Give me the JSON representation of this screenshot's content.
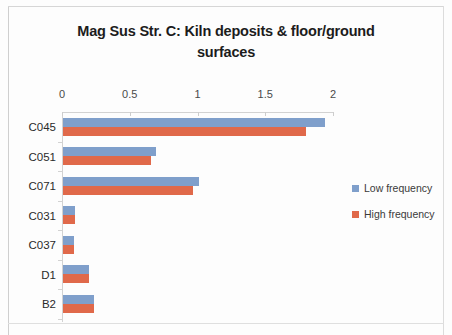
{
  "chart_data": {
    "type": "bar",
    "orientation": "horizontal",
    "title": "Mag Sus Str. C: Kiln deposits & floor/ground surfaces",
    "title_line1": "Mag Sus Str. C: Kiln deposits & floor/ground",
    "title_line2": "surfaces",
    "xlabel": "",
    "ylabel": "",
    "xlim": [
      0,
      2
    ],
    "xticks": [
      "0",
      "0.5",
      "1",
      "1.5",
      "2"
    ],
    "xtick_values": [
      0,
      0.5,
      1,
      1.5,
      2
    ],
    "grid": false,
    "legend_position": "right",
    "categories": [
      "C045",
      "C051",
      "C071",
      "C031",
      "C037",
      "D1",
      "B2"
    ],
    "series": [
      {
        "name": "Low frequency",
        "color": "#7f9fcb",
        "values": [
          1.93,
          0.69,
          1.0,
          0.09,
          0.08,
          0.19,
          0.23
        ]
      },
      {
        "name": "High frequency",
        "color": "#e0694a",
        "values": [
          1.79,
          0.65,
          0.96,
          0.09,
          0.08,
          0.19,
          0.23
        ]
      }
    ]
  },
  "legend": {
    "items": [
      {
        "label": "Low frequency",
        "key": "low"
      },
      {
        "label": "High frequency",
        "key": "high"
      }
    ]
  }
}
